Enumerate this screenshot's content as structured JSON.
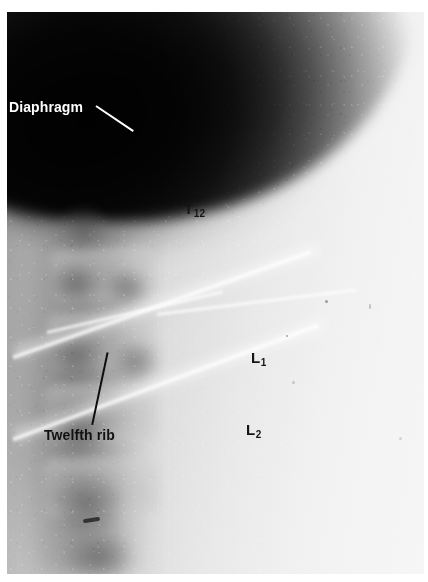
{
  "figure": {
    "kind": "radiograph",
    "modality": "plain film x-ray",
    "region": "thoracolumbar junction",
    "background_color": "#ffffff",
    "film_dark_color": "#070707",
    "film_light_color": "#f5f5f5"
  },
  "annotations": {
    "diaphragm": {
      "text": "Diaphragm",
      "color": "#ffffff",
      "leader_color": "#ffffff"
    },
    "twelfth_rib": {
      "text": "Twelfth rib",
      "color": "#111111",
      "leader_color": "#0d0d0d"
    },
    "vertebrae": [
      {
        "name": "t12",
        "letter": "T",
        "number": "12",
        "color": "#151515"
      },
      {
        "name": "l1",
        "letter": "L",
        "number": "1",
        "color": "#151515"
      },
      {
        "name": "l2",
        "letter": "L",
        "number": "2",
        "color": "#151515"
      }
    ]
  }
}
